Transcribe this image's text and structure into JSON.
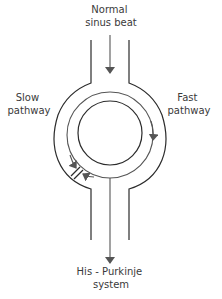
{
  "diagram": {
    "labels": {
      "top": [
        "Normal",
        "sinus beat"
      ],
      "left": [
        "Slow",
        "pathway"
      ],
      "right": [
        "Fast",
        "pathway"
      ],
      "bottom": [
        "His - Purkinje",
        "system"
      ]
    },
    "elements": {
      "entry_arrow": "Normal sinus beat conduction",
      "fast_path_arrow": "Fast pathway conduction (clockwise, right side)",
      "slow_path_arrows": "Slow pathway conduction meeting at block",
      "block_mark": "Conduction block (double bar) on slow pathway",
      "exit_arrow": "Conduction to His-Purkinje system"
    },
    "colors": {
      "outline": "#2b2b2b",
      "arrows": "#555555",
      "text": "#3a3a3a",
      "background": "#ffffff"
    }
  }
}
